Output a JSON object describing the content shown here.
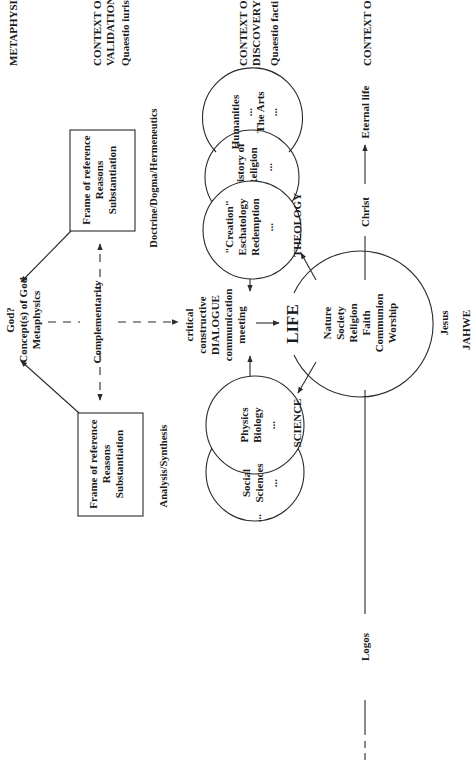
{
  "headers": {
    "metaphysics": "METAPHYSICS",
    "validation": [
      "CONTEXT OF",
      "VALIDATION",
      "Quaestio iuris"
    ],
    "discovery": [
      "CONTEXT OF",
      "DISCOVERY",
      "Quaestio facti"
    ],
    "life": "CONTEXT OF LIFE"
  },
  "boxes": {
    "top": [
      "Frame of reference",
      "Reasons",
      "Substantiation"
    ],
    "bottom": [
      "Frame of reference",
      "Reasons",
      "Substantiation"
    ]
  },
  "side_labels": {
    "doctrine": "Doctrine/Dogma/Hermeneutics",
    "analysis": "Analysis/Synthesis",
    "complementarity": "Complementarity"
  },
  "god": [
    "God?",
    "Concept(s) of God",
    "Metaphysics"
  ],
  "dialogue": [
    "critical",
    "constructive",
    "DIALOGUE",
    "communication",
    "meeting"
  ],
  "circles": {
    "humanities": [
      "Humanities",
      "...",
      "The Arts",
      "..."
    ],
    "history": [
      "History of",
      "Religion",
      "..."
    ],
    "creation": [
      "\"Creation\"",
      "Eschatology",
      "Redemption",
      "..."
    ],
    "physics": [
      "Physics",
      "Biology",
      "..."
    ],
    "social": [
      "Social",
      "Sciences",
      "..."
    ],
    "social_trailing": "...",
    "life_title": "LIFE",
    "life": [
      "Nature",
      "Society",
      "Religion",
      "Faith",
      "Communion",
      "Worship"
    ]
  },
  "disciplines": {
    "theology": "THEOLOGY",
    "science": "SCIENCE"
  },
  "timeline": {
    "logos": "Logos",
    "christ": "Christ",
    "eternal": "Eternal life",
    "jesus": "Jesus",
    "jahwe": "JAHWE"
  }
}
